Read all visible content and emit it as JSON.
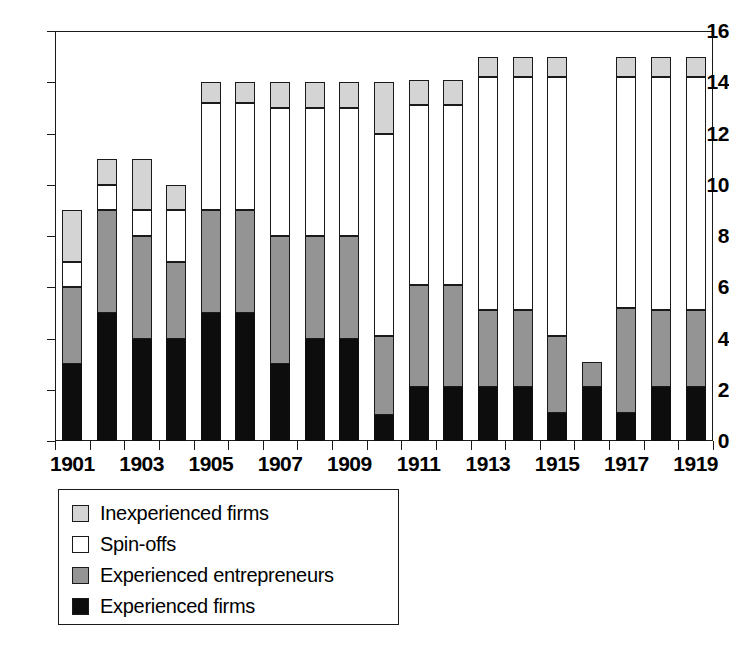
{
  "chart_data": {
    "type": "bar",
    "subtype": "stacked-bar",
    "title": "",
    "subtitle": "",
    "xlabel": "",
    "ylabel": "",
    "ylim": [
      0,
      16
    ],
    "ytick_labels": [
      "0",
      "2",
      "4",
      "6",
      "8",
      "10",
      "12",
      "14",
      "16"
    ],
    "ytick_values": [
      0,
      2,
      4,
      6,
      8,
      10,
      12,
      14,
      16
    ],
    "grid": false,
    "legend_position": "below-plot-left",
    "categories": [
      "1901",
      "1902",
      "1903",
      "1904",
      "1905",
      "1906",
      "1907",
      "1908",
      "1909",
      "1910",
      "1911",
      "1912",
      "1913",
      "1914",
      "1915",
      "1916",
      "1917",
      "1918",
      "1919"
    ],
    "xtick_labels": [
      "1901",
      "1903",
      "1905",
      "1907",
      "1909",
      "1911",
      "1913",
      "1915",
      "1917",
      "1919"
    ],
    "xtick_label_years": [
      1901,
      1903,
      1905,
      1907,
      1909,
      1911,
      1913,
      1915,
      1917,
      1919
    ],
    "series": [
      {
        "name": "Experienced firms",
        "color": "#0d0d0d",
        "values": [
          3,
          5,
          4,
          4,
          5,
          5,
          3,
          4,
          4,
          1,
          2.1,
          2.1,
          2.1,
          2.1,
          1.1,
          2.1,
          1.1,
          2.1,
          2.1
        ]
      },
      {
        "name": "Experienced entrepreneurs",
        "color": "#949494",
        "values": [
          3,
          4,
          4,
          3,
          4,
          4,
          5,
          4,
          4,
          3.1,
          4,
          4,
          3,
          3,
          3,
          1,
          4.1,
          3,
          3
        ]
      },
      {
        "name": "Spin-offs",
        "color": "#ffffff",
        "values": [
          1,
          1,
          1,
          2,
          4.2,
          4.2,
          5,
          5,
          5,
          7.9,
          7,
          7,
          9.1,
          9.1,
          10.1,
          0,
          9,
          9.1,
          9.1
        ]
      },
      {
        "name": "Inexperienced firms",
        "color": "#d4d4d4",
        "values": [
          2,
          1,
          2,
          1,
          0.8,
          0.8,
          1,
          1,
          1,
          2,
          1,
          1,
          0.8,
          0.8,
          0.8,
          0,
          0.8,
          0.8,
          0.8
        ]
      }
    ],
    "totals": [
      9,
      11,
      11,
      10,
      14,
      14,
      14,
      14,
      14,
      14,
      14,
      14,
      15,
      15,
      15,
      3.1,
      15,
      15,
      15
    ],
    "legend": [
      {
        "label": "Inexperienced firms",
        "color": "#d4d4d4",
        "swatch": "light-gray"
      },
      {
        "label": "Spin-offs",
        "color": "#ffffff",
        "swatch": "white"
      },
      {
        "label": "Experienced entrepreneurs",
        "color": "#949494",
        "swatch": "medium-gray"
      },
      {
        "label": "Experienced firms",
        "color": "#0d0d0d",
        "swatch": "black"
      }
    ]
  }
}
